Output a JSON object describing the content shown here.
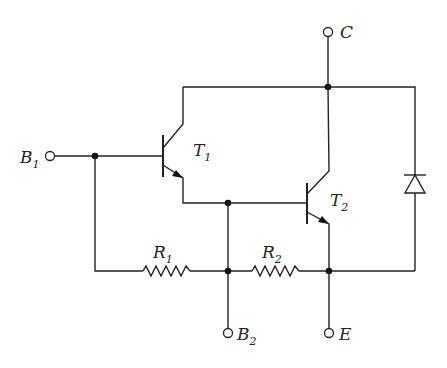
{
  "diagram": {
    "type": "circuit-schematic",
    "terminals": {
      "b1": {
        "main": "B",
        "sub": "1"
      },
      "b2": {
        "main": "B",
        "sub": "2"
      },
      "c": {
        "main": "C",
        "sub": ""
      },
      "e": {
        "main": "E",
        "sub": ""
      }
    },
    "transistors": {
      "t1": {
        "main": "T",
        "sub": "1",
        "type": "NPN"
      },
      "t2": {
        "main": "T",
        "sub": "2",
        "type": "NPN"
      }
    },
    "resistors": {
      "r1": {
        "main": "R",
        "sub": "1"
      },
      "r2": {
        "main": "R",
        "sub": "2"
      }
    },
    "diode": {
      "orientation": "cathode-up",
      "connects": "E to C"
    },
    "colors": {
      "line": "#222222",
      "background": "#ffffff"
    }
  }
}
